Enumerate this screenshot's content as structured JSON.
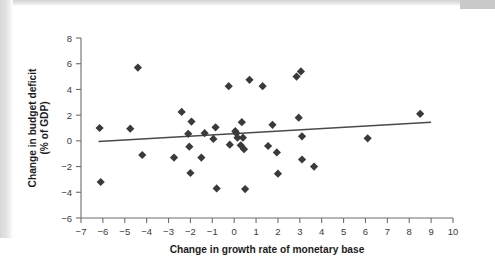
{
  "figure": {
    "background_color": "#ffffff",
    "marker_color": "#3a3a3a",
    "axis_color": "#6d6d6d",
    "trendline_color": "#4a4a4a"
  },
  "chart_data": {
    "type": "scatter",
    "title": "",
    "xlabel": "Change in growth rate of monetary base",
    "ylabel_line1": "Change in budget deficit",
    "ylabel_line2": "(% of GDP)",
    "xlim": [
      -7,
      10
    ],
    "ylim": [
      -6,
      8
    ],
    "xticks": [
      -7,
      -6,
      -5,
      -4,
      -3,
      -2,
      -1,
      0,
      1,
      2,
      3,
      4,
      5,
      6,
      7,
      8,
      9,
      10
    ],
    "yticks": [
      -6,
      -4,
      -2,
      0,
      2,
      4,
      6,
      8
    ],
    "xtick_labels": [
      "-7",
      "-6",
      "-5",
      "-4",
      "-3",
      "-2",
      "-1",
      "0",
      "1",
      "2",
      "3",
      "4",
      "5",
      "6",
      "7",
      "8",
      "9",
      "10"
    ],
    "ytick_labels": [
      "-6",
      "-4",
      "-2",
      "0",
      "2",
      "4",
      "6",
      "8"
    ],
    "grid": false,
    "legend": null,
    "points": [
      [
        -6.15,
        1.0
      ],
      [
        -6.1,
        -3.2
      ],
      [
        -4.75,
        0.95
      ],
      [
        -4.4,
        5.7
      ],
      [
        -4.2,
        -1.1
      ],
      [
        -2.75,
        -1.3
      ],
      [
        -2.4,
        2.25
      ],
      [
        -2.1,
        0.55
      ],
      [
        -2.05,
        -0.45
      ],
      [
        -2.0,
        -2.5
      ],
      [
        -1.95,
        1.5
      ],
      [
        -1.5,
        -1.3
      ],
      [
        -1.35,
        0.6
      ],
      [
        -0.95,
        0.15
      ],
      [
        -0.85,
        1.05
      ],
      [
        -0.8,
        -3.7
      ],
      [
        -0.25,
        4.25
      ],
      [
        -0.2,
        -0.3
      ],
      [
        0.05,
        0.75
      ],
      [
        0.1,
        0.6
      ],
      [
        0.15,
        0.25
      ],
      [
        0.3,
        -0.35
      ],
      [
        0.35,
        1.45
      ],
      [
        0.4,
        0.25
      ],
      [
        0.45,
        -0.65
      ],
      [
        0.5,
        -3.75
      ],
      [
        0.7,
        4.75
      ],
      [
        1.3,
        4.25
      ],
      [
        1.55,
        -0.4
      ],
      [
        1.75,
        1.25
      ],
      [
        1.95,
        -0.9
      ],
      [
        2.0,
        -2.55
      ],
      [
        2.85,
        5.0
      ],
      [
        2.95,
        1.8
      ],
      [
        3.05,
        5.4
      ],
      [
        3.1,
        0.35
      ],
      [
        3.1,
        -1.45
      ],
      [
        3.65,
        -2.0
      ],
      [
        6.1,
        0.2
      ],
      [
        8.5,
        2.1
      ]
    ],
    "trendline": {
      "x": [
        -6.2,
        9.0
      ],
      "y": [
        -0.05,
        1.45
      ]
    }
  }
}
